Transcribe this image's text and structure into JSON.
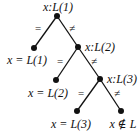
{
  "diagram": {
    "type": "decision-tree",
    "colors": {
      "ink": "#111111",
      "background": "#ffffff"
    },
    "nodes": [
      {
        "id": "n1",
        "label": "x:L(1)",
        "x": 57,
        "y": 16,
        "label_x": 58,
        "label_y": 11,
        "anchor": "middle",
        "kind": "internal"
      },
      {
        "id": "n2",
        "label": "x:L(2)",
        "x": 78,
        "y": 47,
        "label_x": 85,
        "label_y": 51,
        "anchor": "start",
        "kind": "internal"
      },
      {
        "id": "n3",
        "label": "x:L(3)",
        "x": 100,
        "y": 79,
        "label_x": 107,
        "label_y": 83,
        "anchor": "start",
        "kind": "internal"
      },
      {
        "id": "l1",
        "label": "x = L(1)",
        "x": 34,
        "y": 48,
        "label_x": 27,
        "label_y": 64,
        "anchor": "middle",
        "kind": "leaf"
      },
      {
        "id": "l2",
        "label": "x = L(2)",
        "x": 56,
        "y": 80,
        "label_x": 48,
        "label_y": 97,
        "anchor": "middle",
        "kind": "leaf"
      },
      {
        "id": "l3",
        "label": "x = L(3)",
        "x": 77,
        "y": 111,
        "label_x": 71,
        "label_y": 128,
        "anchor": "middle",
        "kind": "leaf"
      },
      {
        "id": "l4",
        "label": "x ∉ L",
        "x": 121,
        "y": 111,
        "label_x": 123,
        "label_y": 128,
        "anchor": "middle",
        "kind": "leaf"
      }
    ],
    "edges": [
      {
        "from": "n1",
        "to": "l1",
        "label": "=",
        "label_x": 38,
        "label_y": 32
      },
      {
        "from": "n1",
        "to": "n2",
        "label": "≠",
        "label_x": 72,
        "label_y": 32
      },
      {
        "from": "n2",
        "to": "l2",
        "label": "=",
        "label_x": 60,
        "label_y": 65
      },
      {
        "from": "n2",
        "to": "n3",
        "label": "≠",
        "label_x": 94,
        "label_y": 65
      },
      {
        "from": "n3",
        "to": "l3",
        "label": "=",
        "label_x": 81,
        "label_y": 97
      },
      {
        "from": "n3",
        "to": "l4",
        "label": "≠",
        "label_x": 117,
        "label_y": 97
      }
    ]
  }
}
